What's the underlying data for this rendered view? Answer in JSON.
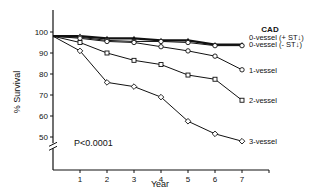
{
  "chart_data": {
    "type": "line",
    "title": "",
    "xlabel": "Year",
    "ylabel": "% Survival",
    "x": [
      0,
      1,
      2,
      3,
      4,
      5,
      6,
      7
    ],
    "xticks": [
      1,
      2,
      3,
      4,
      5,
      6,
      7
    ],
    "yticks": [
      50,
      60,
      70,
      80,
      90,
      100
    ],
    "ylim": [
      45,
      108
    ],
    "xlim": [
      0,
      8
    ],
    "grid": false,
    "axis_break": true,
    "legend_title": "CAD",
    "legend_position": "right",
    "annotation": "P<0.0001",
    "series": [
      {
        "name": "0-vessel (+ ST↓)",
        "marker": "filled-triangle",
        "values": [
          98,
          98,
          97,
          97,
          96,
          96,
          94,
          94
        ]
      },
      {
        "name": "0-vessel (- ST↓)",
        "marker": "open-circle",
        "values": [
          98,
          97.5,
          96,
          95.5,
          95.5,
          95,
          93.5,
          93.5
        ]
      },
      {
        "name": "1-vessel",
        "marker": "open-circle",
        "values": [
          98,
          97,
          95.5,
          95,
          93,
          91,
          88.5,
          82
        ]
      },
      {
        "name": "2-vessel",
        "marker": "open-square",
        "values": [
          98,
          95,
          90,
          86.5,
          84.5,
          79.5,
          77.5,
          67.5
        ]
      },
      {
        "name": "3-vessel",
        "marker": "open-diamond",
        "values": [
          98,
          91,
          76,
          74,
          69,
          57.5,
          51.5,
          48
        ]
      }
    ]
  }
}
